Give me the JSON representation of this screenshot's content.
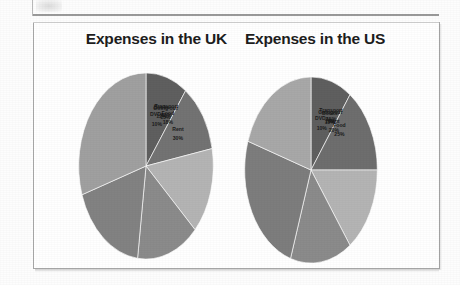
{
  "page": {
    "background_color": "#ffffff",
    "frame_color": "#a8a8a8"
  },
  "charts": [
    {
      "id": "uk",
      "title": "Expenses in the UK"
    },
    {
      "id": "us",
      "title": "Expenses in the US"
    }
  ],
  "chart_data": [
    {
      "type": "pie",
      "title": "Expenses in the UK",
      "xlabel": "",
      "ylabel": "",
      "legend": "none",
      "labels_position": "inside-slices",
      "start_angle_deg": 0,
      "direction": "clockwise",
      "categories": [
        "DVDs",
        "Books",
        "Going out",
        "Transport",
        "Food",
        "Rent"
      ],
      "values": [
        10,
        12,
        15,
        15,
        18,
        30
      ],
      "value_labels": [
        "10%",
        "12%",
        "15%",
        "15%",
        "18%",
        "30%"
      ],
      "colors": [
        "#5f5f5f",
        "#737373",
        "#b4b4b4",
        "#8b8b8b",
        "#828282",
        "#a0a0a0"
      ],
      "slices": [
        {
          "label": "DVDs",
          "value": 10,
          "value_label": "10%",
          "color": "#5f5f5f"
        },
        {
          "label": "Books",
          "value": 12,
          "value_label": "12%",
          "color": "#737373"
        },
        {
          "label": "Going out",
          "value": 15,
          "value_label": "15%",
          "color": "#b4b4b4"
        },
        {
          "label": "Transport",
          "value": 15,
          "value_label": "15%",
          "color": "#8b8b8b"
        },
        {
          "label": "Food",
          "value": 18,
          "value_label": "18%",
          "color": "#828282"
        },
        {
          "label": "Rent",
          "value": 30,
          "value_label": "30%",
          "color": "#a0a0a0"
        }
      ]
    },
    {
      "type": "pie",
      "title": "Expenses in the US",
      "xlabel": "",
      "ylabel": "",
      "legend": "none",
      "labels_position": "inside-slices",
      "start_angle_deg": 0,
      "direction": "clockwise",
      "categories": [
        "DVDs",
        "Books",
        "Going out",
        "Transport",
        "Food",
        "Rent"
      ],
      "values": [
        10,
        15,
        15,
        15,
        25,
        20
      ],
      "value_labels": [
        "10%",
        "15%",
        "15%",
        "15%",
        "25%",
        "20%"
      ],
      "colors": [
        "#5f5f5f",
        "#6e6e6e",
        "#b4b4b4",
        "#8b8b8b",
        "#7d7d7d",
        "#a8a8a8"
      ],
      "slices": [
        {
          "label": "DVDs",
          "value": 10,
          "value_label": "10%",
          "color": "#5f5f5f"
        },
        {
          "label": "Books",
          "value": 15,
          "value_label": "15%",
          "color": "#6e6e6e"
        },
        {
          "label": "Going out",
          "value": 15,
          "value_label": "15%",
          "color": "#b4b4b4"
        },
        {
          "label": "Transport",
          "value": 15,
          "value_label": "15%",
          "color": "#8b8b8b"
        },
        {
          "label": "Food",
          "value": 25,
          "value_label": "25%",
          "color": "#7d7d7d"
        },
        {
          "label": "Rent",
          "value": 20,
          "value_label": "20%",
          "color": "#a8a8a8"
        }
      ]
    }
  ]
}
